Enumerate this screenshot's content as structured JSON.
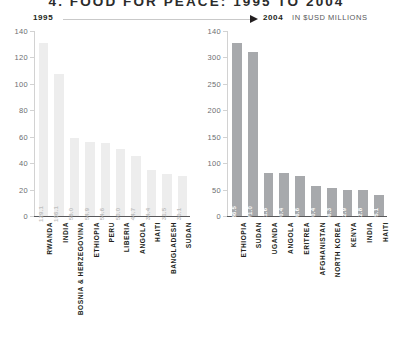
{
  "title": "4. FOOD FOR PEACE: 1995 TO 2004",
  "title_number": "4.",
  "title_text": "FOOD FOR PEACE: 1995 TO 2004",
  "header": {
    "left_year": "1995",
    "right_year": "2004",
    "units": "IN $USD MILLIONS",
    "arrow_icon": "right-arrow-icon"
  },
  "chart_data": [
    {
      "type": "bar",
      "title": "1995",
      "xlabel": "",
      "ylabel": "",
      "ylim": [
        0,
        140
      ],
      "yticks": [
        140,
        120,
        100,
        80,
        60,
        40,
        20,
        0
      ],
      "grid": false,
      "legend": "none",
      "bar_color": "#ededed",
      "categories": [
        "RWANDA",
        "INDIA",
        "BOSNIA & HERZEGOVINA",
        "ETHIOPIA",
        "PERU",
        "LIBERIA",
        "ANGOLA",
        "HAITI",
        "BANGLADESH",
        "SUDAN"
      ],
      "values": [
        129.1,
        106.1,
        58.0,
        54.9,
        54.6,
        50.0,
        44.7,
        34.4,
        31.5,
        30.1
      ],
      "value_labels": [
        "129.1",
        "106.1",
        "58.0",
        "54.9",
        "54.6",
        "50.0",
        "44.7",
        "34.4",
        "31.5",
        "30.1"
      ]
    },
    {
      "type": "bar",
      "title": "2004",
      "xlabel": "",
      "ylabel": "IN $USD MILLIONS",
      "ylim": [
        0,
        320
      ],
      "yticks": [
        140,
        300,
        250,
        200,
        150,
        100,
        50,
        0
      ],
      "grid": false,
      "legend": "none",
      "bar_color": "#a7a9ac",
      "categories": [
        "ETHIOPIA",
        "SUDAN",
        "UGANDA",
        "ANGOLA",
        "ERITREA",
        "AFGHANISTAN",
        "NORTH KOREA",
        "KENYA",
        "INDIA",
        "HAITI"
      ],
      "values": [
        286.5,
        271.0,
        71.6,
        70.4,
        66.6,
        50.4,
        46.3,
        42.9,
        42.8,
        35.1
      ],
      "value_labels": [
        "286.5",
        "271.0",
        "71.6",
        "70.4",
        "66.6",
        "50.4",
        "46.3",
        "42.9",
        "42.8",
        "35.1"
      ]
    }
  ]
}
